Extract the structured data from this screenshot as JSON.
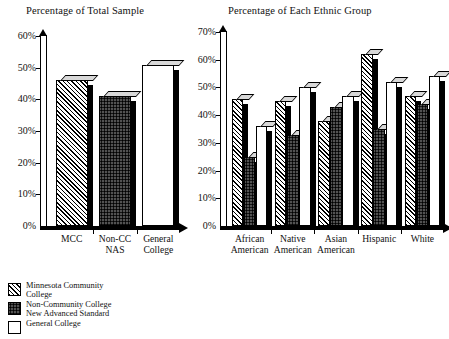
{
  "figure": {
    "background": "#ffffff",
    "ink": "#000000"
  },
  "legend": {
    "position": "bottom-left",
    "items": [
      {
        "key": "mcc",
        "line1": "Minnesota Community",
        "line2": "College",
        "pattern": "diagonal-hatch"
      },
      {
        "key": "noncc",
        "line1": "Non-Community College",
        "line2": "New Advanced Standard",
        "pattern": "dots"
      },
      {
        "key": "gc",
        "line1": "General College",
        "line2": "",
        "pattern": "white"
      }
    ]
  },
  "charts": [
    {
      "id": "total-sample",
      "title": "Percentage of Total Sample"
    },
    {
      "id": "ethnic-group",
      "title": "Percentage of Each Ethnic Group"
    }
  ],
  "chart_data": [
    {
      "type": "bar",
      "id": "total-sample",
      "title": "Percentage of Total Sample",
      "xlabel": "",
      "ylabel": "",
      "ylim": [
        0,
        60
      ],
      "ytick_labels": [
        "0%",
        "10%",
        "20%",
        "30%",
        "40%",
        "50%",
        "60%"
      ],
      "ytick_values": [
        0,
        10,
        20,
        30,
        40,
        50,
        60
      ],
      "grid": false,
      "legend_position": "external-bottom-left",
      "categories": [
        "MCC",
        "Non-CC NAS",
        "General College"
      ],
      "category_lines": [
        [
          "MCC"
        ],
        [
          "Non-CC",
          "NAS"
        ],
        [
          "General",
          "College"
        ]
      ],
      "values": [
        46,
        41,
        51
      ],
      "bar_patterns": [
        "diagonal-hatch",
        "dots",
        "white"
      ]
    },
    {
      "type": "bar",
      "id": "ethnic-group",
      "title": "Percentage of Each Ethnic Group",
      "xlabel": "",
      "ylabel": "",
      "ylim": [
        0,
        70
      ],
      "ytick_labels": [
        "0%",
        "10%",
        "20%",
        "30%",
        "40%",
        "50%",
        "60%",
        "70%"
      ],
      "ytick_values": [
        0,
        10,
        20,
        30,
        40,
        50,
        60,
        70
      ],
      "grid": false,
      "legend_position": "external-bottom-left",
      "categories": [
        "African American",
        "Native American",
        "Asian American",
        "Hispanic",
        "White"
      ],
      "category_lines": [
        [
          "African",
          "American"
        ],
        [
          "Native",
          "American"
        ],
        [
          "Asian",
          "American"
        ],
        [
          "Hispanic"
        ],
        [
          "White"
        ]
      ],
      "series": [
        {
          "name": "Minnesota Community College",
          "pattern": "diagonal-hatch",
          "values": [
            46,
            45,
            38,
            62,
            47
          ]
        },
        {
          "name": "Non-Community College New Advanced Standard",
          "pattern": "dots",
          "values": [
            25,
            33,
            43,
            35,
            44
          ]
        },
        {
          "name": "General College",
          "pattern": "white",
          "values": [
            36,
            50,
            47,
            52,
            54
          ]
        }
      ]
    }
  ]
}
